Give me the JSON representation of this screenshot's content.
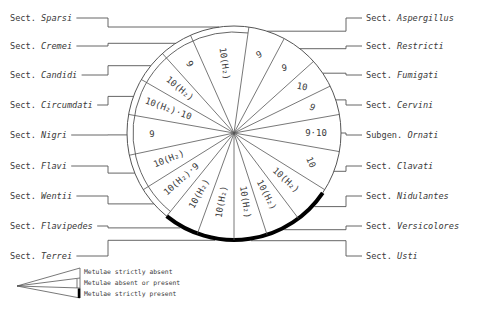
{
  "diagram": {
    "center": [
      234,
      133
    ],
    "radius": 107,
    "inner_ring_radius": 101,
    "colors": {
      "line": "#555555",
      "text": "#3a3a3a",
      "thick_arc": "#000000",
      "background": "#ffffff"
    },
    "sections": [
      {
        "id": "aspergillus",
        "prefix": "Sect.",
        "name": "Aspergillus",
        "value": "9",
        "metulae": "strictly absent",
        "start": 8,
        "end": 28,
        "side": "right",
        "label_y": 18
      },
      {
        "id": "restricti",
        "prefix": "Sect.",
        "name": "Restricti",
        "value": "9",
        "metulae": "strictly absent",
        "start": 28,
        "end": 48,
        "side": "right",
        "label_y": 46
      },
      {
        "id": "fumigati",
        "prefix": "Sect.",
        "name": "Fumigati",
        "value": "10",
        "metulae": "strictly absent",
        "start": 48,
        "end": 64,
        "side": "right",
        "label_y": 75
      },
      {
        "id": "cervini",
        "prefix": "Sect.",
        "name": "Cervini",
        "value": "9",
        "metulae": "strictly absent",
        "start": 64,
        "end": 80,
        "side": "right",
        "label_y": 105
      },
      {
        "id": "ornati",
        "prefix": "Subgen.",
        "name": "Ornati",
        "value": "9·10",
        "metulae": "strictly absent",
        "start": 80,
        "end": 100,
        "side": "right",
        "label_y": 135
      },
      {
        "id": "clavati",
        "prefix": "Sect.",
        "name": "Clavati",
        "value": "10",
        "metulae": "strictly absent",
        "start": 100,
        "end": 122,
        "side": "right",
        "label_y": 166
      },
      {
        "id": "nidulantes",
        "prefix": "Sect.",
        "name": "Nidulantes",
        "value": "10(H₂)",
        "metulae": "strictly present",
        "start": 122,
        "end": 143,
        "side": "right",
        "label_y": 196
      },
      {
        "id": "versicolores",
        "prefix": "Sect.",
        "name": "Versicolores",
        "value": "10(H₂)",
        "metulae": "strictly present",
        "start": 143,
        "end": 162,
        "side": "right",
        "label_y": 226
      },
      {
        "id": "usti",
        "prefix": "Sect.",
        "name": "Usti",
        "value": "10(H₂)",
        "metulae": "strictly present",
        "start": 162,
        "end": 180,
        "side": "right",
        "label_y": 256
      },
      {
        "id": "terrei",
        "prefix": "Sect.",
        "name": "Terrei",
        "value": "10(H₂)",
        "metulae": "strictly present",
        "start": 180,
        "end": 200,
        "side": "left",
        "label_y": 256
      },
      {
        "id": "flavipedes",
        "prefix": "Sect.",
        "name": "Flavipedes",
        "value": "10(H₂)",
        "metulae": "strictly present",
        "start": 200,
        "end": 219,
        "side": "left",
        "label_y": 226
      },
      {
        "id": "wentii",
        "prefix": "Sect.",
        "name": "Wentii",
        "value": "10(H₂)·9",
        "metulae": "absent or present",
        "start": 219,
        "end": 238,
        "side": "left",
        "label_y": 196
      },
      {
        "id": "flavi",
        "prefix": "Sect.",
        "name": "Flavi",
        "value": "10(H₂)",
        "metulae": "absent or present",
        "start": 238,
        "end": 258,
        "side": "left",
        "label_y": 166
      },
      {
        "id": "nigri",
        "prefix": "Sect.",
        "name": "Nigri",
        "value": "9",
        "metulae": "absent or present",
        "start": 258,
        "end": 280,
        "side": "left",
        "label_y": 135
      },
      {
        "id": "circumdati",
        "prefix": "Sect.",
        "name": "Circumdati",
        "value": "10(H₂)·10",
        "metulae": "absent or present",
        "start": 280,
        "end": 300,
        "side": "left",
        "label_y": 105
      },
      {
        "id": "candidi",
        "prefix": "Sect.",
        "name": "Candidi",
        "value": "10(H₂)",
        "metulae": "absent or present",
        "start": 300,
        "end": 318,
        "side": "left",
        "label_y": 75
      },
      {
        "id": "cremei",
        "prefix": "Sect.",
        "name": "Cremei",
        "value": "9",
        "metulae": "absent or present",
        "start": 318,
        "end": 336,
        "side": "left",
        "label_y": 46
      },
      {
        "id": "sparsi",
        "prefix": "Sect.",
        "name": "Sparsi",
        "value": "10(H₂)",
        "metulae": "absent or present",
        "start": 336,
        "end": 368,
        "side": "left",
        "label_y": 18
      }
    ],
    "thick_arc": {
      "start": 124,
      "end": 219
    },
    "double_ring": {
      "start": 219,
      "end": 368
    }
  },
  "legend": {
    "items": [
      {
        "label": "Metulae strictly absent",
        "style": "single"
      },
      {
        "label": "Metulae absent or present",
        "style": "double"
      },
      {
        "label": "Metulae strictly present",
        "style": "thick"
      }
    ]
  }
}
